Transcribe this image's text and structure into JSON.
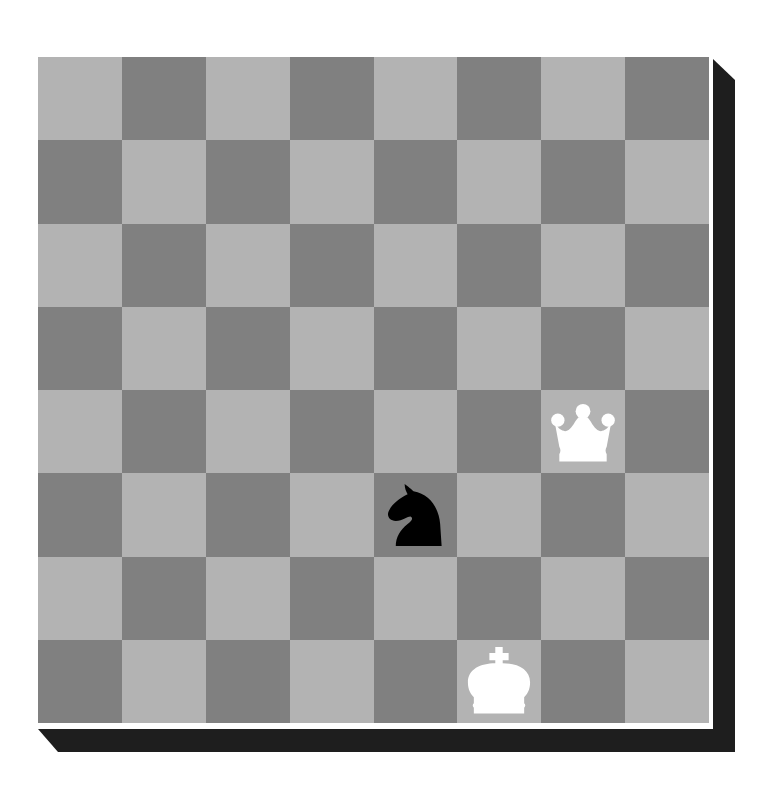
{
  "board": {
    "files": [
      "a",
      "b",
      "c",
      "d",
      "e",
      "f",
      "g",
      "h"
    ],
    "ranks": [
      8,
      7,
      6,
      5,
      4,
      3,
      2,
      1
    ],
    "colors": {
      "light": "#b3b3b3",
      "dark": "#808080",
      "shadow": "#1e1e1e",
      "frame": "#ffffff"
    },
    "orientation": "white-bottom",
    "top_left_square_color": "light"
  },
  "pieces": [
    {
      "square": "g4",
      "color": "white",
      "type": "queen",
      "icon": "white-queen-icon"
    },
    {
      "square": "e3",
      "color": "black",
      "type": "knight",
      "icon": "black-knight-icon"
    },
    {
      "square": "f1",
      "color": "white",
      "type": "king",
      "icon": "white-king-icon"
    }
  ]
}
